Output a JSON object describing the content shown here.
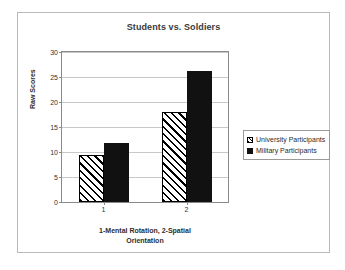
{
  "chart_data": {
    "type": "bar",
    "title": "Students vs. Soldiers",
    "xlabel": "1-Mental Rotation, 2-Spatial Orientation",
    "xlabel_lines": [
      "1-Mental Rotation, 2-Spatial",
      "Orientation"
    ],
    "ylabel": "Raw Scores",
    "categories": [
      "1",
      "2"
    ],
    "ylim": [
      0,
      30
    ],
    "yticks": [
      0,
      5,
      10,
      15,
      20,
      25,
      30
    ],
    "ytick_labels": [
      "0",
      "5",
      "10",
      "15",
      "20",
      "25",
      "30"
    ],
    "grid": true,
    "legend_position": "right",
    "series": [
      {
        "name": "University Participants",
        "values": [
          9.5,
          18.0
        ],
        "fill": "diagonal-hatch",
        "color": "#ffffff",
        "edge_color": "#000000"
      },
      {
        "name": "Military Participants",
        "values": [
          11.8,
          26.3
        ],
        "fill": "solid",
        "color": "#111111",
        "edge_color": "#111111"
      }
    ]
  },
  "legend": {
    "items": [
      {
        "label": "University Participants",
        "swatch": "hatched-square-icon"
      },
      {
        "label": "Military Participants",
        "swatch": "filled-square-icon"
      }
    ]
  },
  "colors": {
    "title_text": "#3a3a3a",
    "axis_text": "#333333",
    "gridline": "#c8c8c8",
    "axis_line": "#8a8a8a",
    "frame_border": "#b9b9b9",
    "series_military": "#111111",
    "series_university": "#ffffff"
  }
}
